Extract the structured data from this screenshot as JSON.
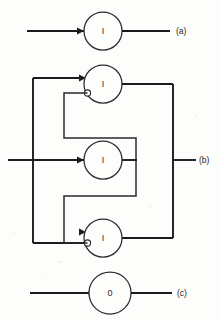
{
  "figure": {
    "background_color": "#fdfdfc",
    "line_color": "#1b1b1b",
    "node_fill": "#fdfdfc"
  },
  "panels": [
    {
      "id": "panel-a",
      "label": "(a)",
      "node_label": "I",
      "description": "single excitatory unit with input line and output line"
    },
    {
      "id": "panel-b",
      "label": "(b)",
      "node_labels": [
        "I",
        "I",
        "I"
      ],
      "description": "three units in parallel with recurrent inhibitory feedback"
    },
    {
      "id": "panel-c",
      "label": "(c)",
      "node_label": "0",
      "description": "single unit with inhibitory input terminal"
    }
  ],
  "nodes": [
    {
      "id": "node-a",
      "label": "I",
      "cx": 103,
      "cy": 31,
      "r": 19
    },
    {
      "id": "node-b-top",
      "label": "I",
      "cx": 103,
      "cy": 84,
      "r": 19
    },
    {
      "id": "node-b-mid",
      "label": "I",
      "cx": 103,
      "cy": 160,
      "r": 19
    },
    {
      "id": "node-b-bot",
      "label": "I",
      "cx": 103,
      "cy": 238,
      "r": 19
    },
    {
      "id": "node-c",
      "label": "0",
      "cx": 110,
      "cy": 293,
      "r": 21
    }
  ],
  "labels": {
    "a": "(a)",
    "b": "(b)",
    "c": "(c)"
  }
}
